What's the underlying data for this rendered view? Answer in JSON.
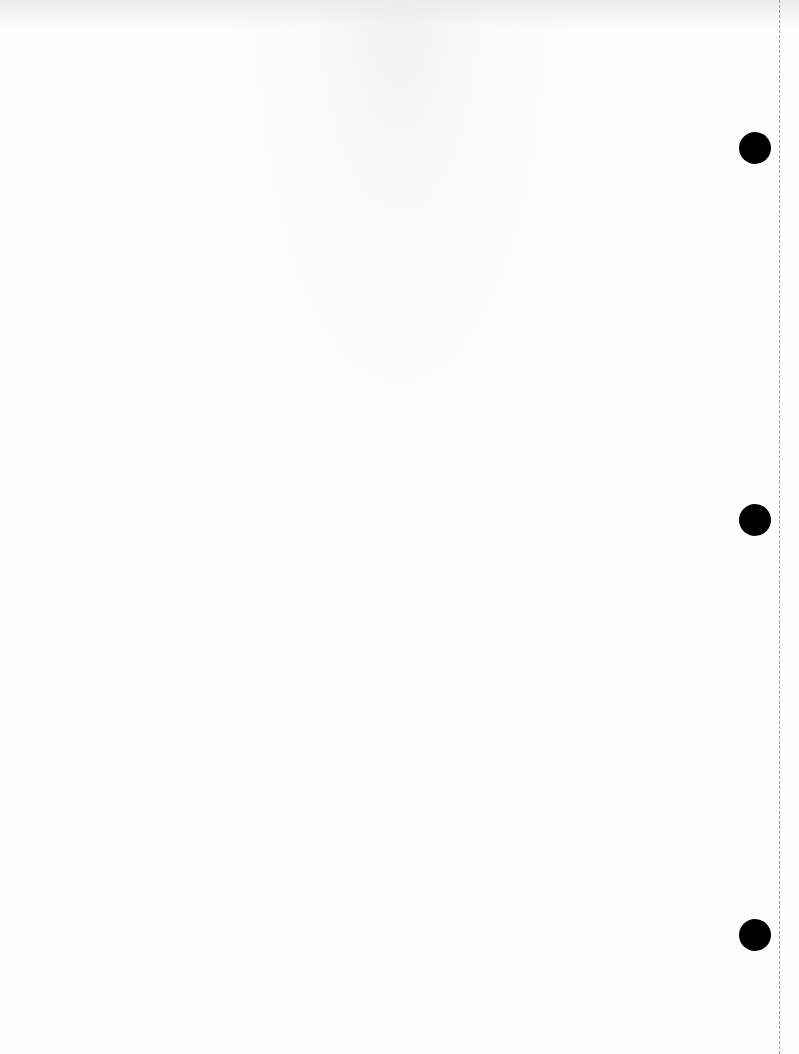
{
  "document": {
    "type": "scanned blank page with faint bleed-through",
    "bleed_through_text": [],
    "background_color": "#fdfdfd",
    "punch_holes": [
      {
        "cx": 755,
        "cy": 148,
        "r": 16
      },
      {
        "cx": 755,
        "cy": 520,
        "r": 16
      },
      {
        "cx": 755,
        "cy": 935,
        "r": 16
      }
    ],
    "perforation": {
      "x": 779,
      "style": "dashed",
      "color": "#9a9a9a"
    }
  }
}
